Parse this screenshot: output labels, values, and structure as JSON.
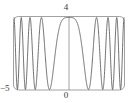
{
  "chart_data": {
    "type": "line",
    "title": "",
    "subtitle": "",
    "xlabel": "",
    "ylabel": "",
    "xlim": [
      -5,
      5
    ],
    "ylim": [
      0,
      4
    ],
    "grid": false,
    "legend": null,
    "frame": "rounded-box",
    "axes": {
      "x_axis_visible": false,
      "y_axis_visible": true,
      "y_axis_at_x": 0
    },
    "tick_labels": {
      "y_max": "4",
      "x_origin": "0",
      "x_min": "−5"
    },
    "annotations": [],
    "series": [
      {
        "name": "chirp",
        "expression": "2 + 2*cos(x^2)",
        "color": "#4a4a4a",
        "line_width": 0.8,
        "x": [
          -5,
          -4.9,
          -4.8,
          -4.7,
          -4.6,
          -4.5,
          -4.4,
          -4.3,
          -4.2,
          -4.1,
          -4,
          -3.9,
          -3.8,
          -3.7,
          -3.6,
          -3.5,
          -3.4,
          -3.3,
          -3.2,
          -3.1,
          -3,
          -2.9,
          -2.8,
          -2.7,
          -2.6,
          -2.5,
          -2.4,
          -2.3,
          -2.2,
          -2.1,
          -2,
          -1.9,
          -1.8,
          -1.7,
          -1.6,
          -1.5,
          -1.4,
          -1.3,
          -1.2,
          -1.1,
          -1,
          -0.9,
          -0.8,
          -0.7,
          -0.6,
          -0.5,
          -0.4,
          -0.3,
          -0.2,
          -0.1,
          0,
          0.1,
          0.2,
          0.3,
          0.4,
          0.5,
          0.6,
          0.7,
          0.8,
          0.9,
          1,
          1.1,
          1.2,
          1.3,
          1.4,
          1.5,
          1.6,
          1.7,
          1.8,
          1.9,
          2,
          2.1,
          2.2,
          2.3,
          2.4,
          2.5,
          2.6,
          2.7,
          2.8,
          2.9,
          3,
          3.1,
          3.2,
          3.3,
          3.4,
          3.5,
          3.6,
          3.7,
          3.8,
          3.9,
          4,
          4.1,
          4.2,
          4.3,
          4.4,
          4.5,
          4.6,
          4.7,
          4.8,
          4.9,
          5
        ],
        "y": [
          3.4,
          1.11,
          0.04,
          1.17,
          3.46,
          3.37,
          0.84,
          0.05,
          1.8,
          3.86,
          2.65,
          0.19,
          0.56,
          3.09,
          3.89,
          1.21,
          0.0,
          2.14,
          3.96,
          1.86,
          0.04,
          1.11,
          3.76,
          2.71,
          0.08,
          0.41,
          3.16,
          3.6,
          0.61,
          0.02,
          2.17,
          3.92,
          1.25,
          0.0,
          0.82,
          3.58,
          3.31,
          0.53,
          0.14,
          2.8,
          3.92,
          1.1,
          0.22,
          2.41,
          3.76,
          3.23,
          2.5,
          1.84,
          1.3,
          0.99,
          4.0,
          3.99,
          3.97,
          3.92,
          3.87,
          3.74,
          3.56,
          3.31,
          2.99,
          2.6,
          2.16,
          1.69,
          1.22,
          0.78,
          0.41,
          0.15,
          0.01,
          0.02,
          0.18,
          0.49,
          0.96,
          1.54,
          2.2,
          2.89,
          3.48,
          3.88,
          4.0,
          3.82,
          3.35,
          2.66,
          1.83,
          1.03,
          0.38,
          0.03,
          0.03,
          0.38,
          1.05,
          1.88,
          2.74,
          3.45,
          3.88,
          3.97,
          3.68,
          3.02,
          2.13,
          1.17,
          0.39,
          0.01,
          0.09,
          0.64,
          1.5
        ]
      }
    ]
  }
}
